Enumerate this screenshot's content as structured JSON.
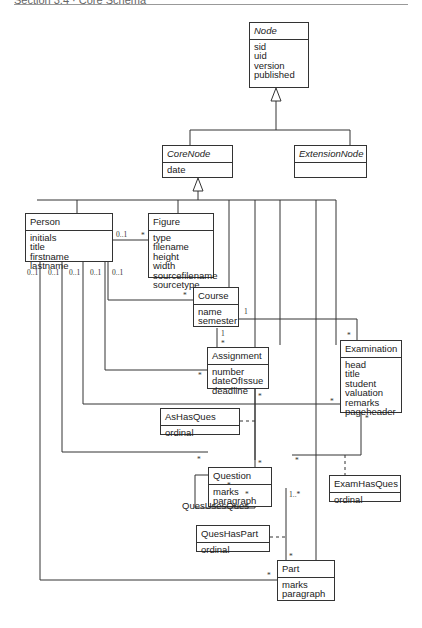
{
  "header": {
    "title": "Section 3.4 · Core Schema"
  },
  "classes": {
    "node": {
      "name": "Node",
      "abstract": true,
      "attributes": [
        "sid",
        "uid",
        "version",
        "published"
      ]
    },
    "corenode": {
      "name": "CoreNode",
      "abstract": true,
      "attributes": [
        "date"
      ]
    },
    "extensionnode": {
      "name": "ExtensionNode",
      "abstract": true,
      "attributes": []
    },
    "person": {
      "name": "Person",
      "attributes": [
        "initials",
        "title",
        "firstname",
        "lastname"
      ]
    },
    "figure": {
      "name": "Figure",
      "attributes": [
        "type",
        "filename",
        "height",
        "width",
        "sourcefilename",
        "sourcetype"
      ]
    },
    "course": {
      "name": "Course",
      "attributes": [
        "name",
        "semester"
      ]
    },
    "assignment": {
      "name": "Assignment",
      "attributes": [
        "number",
        "dateOfIssue",
        "deadline"
      ]
    },
    "examination": {
      "name": "Examination",
      "attributes": [
        "head",
        "title",
        "student",
        "valuation",
        "remarks",
        "pageheader"
      ]
    },
    "ashasques": {
      "name": "AsHasQues",
      "attributes": [
        "ordinal"
      ]
    },
    "question": {
      "name": "Question",
      "attributes": [
        "marks",
        "paragraph"
      ]
    },
    "examhasques": {
      "name": "ExamHasQues",
      "attributes": [
        "ordinal"
      ]
    },
    "queshaspart": {
      "name": "QuesHasPart",
      "attributes": [
        "ordinal"
      ]
    },
    "part": {
      "name": "Part",
      "attributes": [
        "marks",
        "paragraph"
      ]
    }
  },
  "associations": {
    "quesusesques_label": "QuesUsesQues"
  },
  "multiplicities": {
    "person_figure": "0..1",
    "figure_person": "*",
    "person_1": "0..1",
    "person_2": "0..1",
    "person_3": "0..1",
    "person_4": "0..1",
    "person_5": "0..1",
    "course_person": "*",
    "course_exam": "1",
    "course_assign": "1",
    "assign_course": "*",
    "exam_course": "*",
    "assign_person": "*",
    "assign_question": "*",
    "exam_person": "*",
    "exam_question": "*",
    "question_assign": "*",
    "question_person": "*",
    "question_exam": "*",
    "ques_uses_1": "*",
    "ques_uses_2": "*",
    "question_part": "1..*",
    "part_question": "*",
    "part_person": "*"
  },
  "colors": {
    "line": "#333333",
    "background": "#ffffff"
  }
}
